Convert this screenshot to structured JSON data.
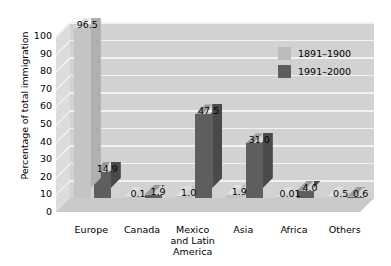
{
  "chart_data": {
    "type": "bar",
    "title": "",
    "xlabel": "",
    "ylabel": "Percentage of total immigration",
    "ylim": [
      0,
      100
    ],
    "ytick_labels": [
      "100",
      "90",
      "80",
      "70",
      "60",
      "50",
      "40",
      "30",
      "20",
      "10",
      "0"
    ],
    "grid": true,
    "legend_position": "top-right",
    "categories": [
      "Europe",
      "Canada",
      "Mexico\nand Latin\nAmerica",
      "Asia",
      "Africa",
      "Others"
    ],
    "series": [
      {
        "name": "1891–1900",
        "color": "#bcbcbc",
        "values": [
          96.5,
          0.1,
          1.0,
          1.9,
          0.01,
          0.5
        ],
        "labels": [
          "96.5",
          "0.1",
          "1.0",
          "1.9",
          "0.01",
          "0.5"
        ]
      },
      {
        "name": "1991–2000",
        "color": "#5e5e5e",
        "values": [
          14.9,
          1.9,
          47.5,
          31.0,
          4.0,
          0.6
        ],
        "labels": [
          "14.9",
          "1.9",
          "47.5",
          "31.0",
          "4.0",
          "0.6"
        ]
      }
    ]
  },
  "legend": {
    "items": [
      {
        "label": "1891–1900",
        "swatch": "light"
      },
      {
        "label": "1991–2000",
        "swatch": "dark"
      }
    ]
  }
}
